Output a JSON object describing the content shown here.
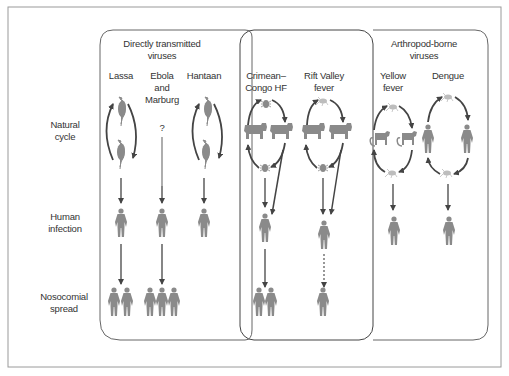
{
  "figure": {
    "row_labels": {
      "natural_cycle": [
        "Natural",
        "cycle"
      ],
      "human_infection": [
        "Human",
        "infection"
      ],
      "nosocomial_spread": [
        "Nosocomial",
        "spread"
      ]
    },
    "groups": [
      {
        "id": "directly-transmitted",
        "title": [
          "Directly transmitted",
          "viruses"
        ],
        "viruses": [
          {
            "name": [
              "Lassa"
            ],
            "reservoir": "rodent",
            "cycle": "rodent-loop",
            "human_infection": true,
            "nosocomial_count": 2,
            "nosocomial_style": "solid"
          },
          {
            "name": [
              "Ebola",
              "and",
              "Marburg"
            ],
            "reservoir": "unknown",
            "unknown_mark": "?",
            "human_infection": true,
            "nosocomial_count": 3,
            "nosocomial_style": "solid"
          },
          {
            "name": [
              "Hantaan"
            ],
            "reservoir": "rodent",
            "cycle": "rodent-loop",
            "human_infection": true,
            "nosocomial_count": 0
          }
        ]
      },
      {
        "id": "highlighted",
        "title": [],
        "viruses": [
          {
            "name": [
              "Crimean–",
              "Congo HF"
            ],
            "vector": "tick",
            "host": "livestock",
            "human_infection": true,
            "nosocomial_count": 2,
            "nosocomial_style": "solid"
          },
          {
            "name": [
              "Rift Valley",
              "fever"
            ],
            "vector": "mosquito",
            "host": "livestock",
            "human_infection": true,
            "nosocomial_count": 1,
            "nosocomial_style": "dotted"
          }
        ]
      },
      {
        "id": "arthropod-borne",
        "title": [
          "Arthropod-borne",
          "viruses"
        ],
        "viruses": [
          {
            "name": [
              "Yellow",
              "fever"
            ],
            "vector": "mosquito",
            "host": "monkey",
            "human_infection": true,
            "nosocomial_count": 0
          },
          {
            "name": [
              "Dengue"
            ],
            "vector": "mosquito",
            "host": "human",
            "human_infection": true,
            "nosocomial_count": 0
          }
        ]
      }
    ],
    "colors": {
      "figure_gray": "#8a8a8a",
      "arrow": "#444444",
      "frame": "#9a9a9a",
      "panel_border": "#555555",
      "mosquito": "#b8b8b8"
    }
  }
}
